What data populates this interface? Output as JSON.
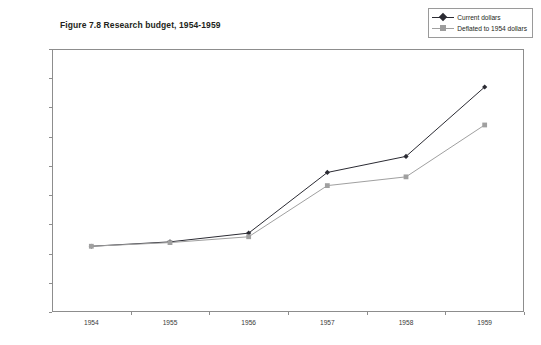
{
  "chart_data": {
    "type": "line",
    "title": "Figure 7.8 Research budget, 1954-1959",
    "xlabel": "",
    "ylabel": "Millions of dollars",
    "categories": [
      "1954",
      "1955",
      "1956",
      "1957",
      "1958",
      "1959"
    ],
    "series": [
      {
        "name": "Current dollars",
        "values": [
          4.5,
          4.8,
          5.4,
          9.55,
          10.65,
          15.4
        ],
        "color": "#2b2b33",
        "marker": "diamond"
      },
      {
        "name": "Deflated to 1954 dollars",
        "values": [
          4.5,
          4.75,
          5.15,
          8.65,
          9.25,
          12.8
        ],
        "color": "#a0a0a0",
        "marker": "square"
      }
    ],
    "ylim": [
      0,
      18
    ],
    "ytick_step": 2,
    "yticks": [
      "18",
      "16",
      "14",
      "12",
      "10",
      "8",
      "6",
      "4",
      "2",
      "0"
    ],
    "grid": false,
    "legend_position": "top-right"
  },
  "legend": {
    "entries": [
      {
        "label": "Current dollars"
      },
      {
        "label": "Deflated to 1954 dollars"
      }
    ]
  },
  "colors": {
    "series_current": "#2b2b33",
    "series_deflated": "#a0a0a0",
    "axis": "#8d8d8d",
    "text": "#231f20",
    "background": "#ffffff"
  }
}
